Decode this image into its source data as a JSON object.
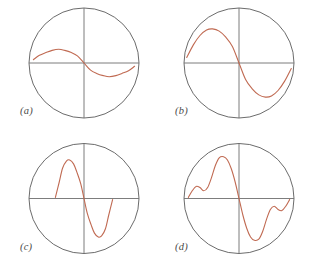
{
  "figure": {
    "background_color": "#ffffff",
    "panel_count": 4,
    "columns": 2,
    "rows": 2,
    "circle_stroke_color": "#5a5a5a",
    "axis_stroke_color": "#6e6e6e",
    "curve_stroke_color": "#c06a52",
    "label_color": "#4a4a4a"
  },
  "panels": [
    {
      "id": "panel-a",
      "label": "(a)",
      "label_x": 20,
      "label_y": 108,
      "circle": {
        "cx": 84,
        "cy": 63,
        "r": 55
      },
      "axes": {
        "horizontal": {
          "x1": 29,
          "y1": 63,
          "x2": 139,
          "y2": 63
        },
        "vertical": {
          "x1": 84,
          "y1": 8,
          "x2": 84,
          "y2": 118
        }
      },
      "chart_data": {
        "type": "line",
        "title": "(a)",
        "description": "single-cycle sine wave, low amplitude, wide span",
        "xlabel": "",
        "ylabel": "",
        "xlim": [
          -1,
          1
        ],
        "ylim": [
          -1,
          1
        ],
        "grid": false,
        "legend": "none",
        "harmonics": [
          {
            "n": 1,
            "amplitude": 0.25
          }
        ],
        "x": [
          -0.92,
          -0.81,
          -0.69,
          -0.58,
          -0.46,
          -0.35,
          -0.23,
          -0.12,
          0.0,
          0.12,
          0.23,
          0.35,
          0.46,
          0.58,
          0.69,
          0.81,
          0.92
        ],
        "y": [
          0.06,
          0.14,
          0.19,
          0.23,
          0.25,
          0.23,
          0.19,
          0.13,
          0.0,
          -0.13,
          -0.19,
          -0.23,
          -0.25,
          -0.23,
          -0.19,
          -0.14,
          -0.06
        ]
      }
    },
    {
      "id": "panel-b",
      "label": "(b)",
      "label_x": 20,
      "label_y": 108,
      "circle": {
        "cx": 84,
        "cy": 63,
        "r": 55
      },
      "axes": {
        "horizontal": {
          "x1": 29,
          "y1": 63,
          "x2": 139,
          "y2": 63
        },
        "vertical": {
          "x1": 84,
          "y1": 8,
          "x2": 84,
          "y2": 118
        }
      },
      "chart_data": {
        "type": "line",
        "title": "(b)",
        "description": "single-cycle sine wave, large amplitude, wide span",
        "xlabel": "",
        "ylabel": "",
        "xlim": [
          -1,
          1
        ],
        "ylim": [
          -1,
          1
        ],
        "grid": false,
        "legend": "none",
        "harmonics": [
          {
            "n": 1,
            "amplitude": 0.62
          }
        ],
        "x": [
          -0.95,
          -0.83,
          -0.71,
          -0.59,
          -0.48,
          -0.36,
          -0.24,
          -0.12,
          0.0,
          0.12,
          0.24,
          0.36,
          0.48,
          0.59,
          0.71,
          0.83,
          0.95
        ],
        "y": [
          0.1,
          0.33,
          0.5,
          0.6,
          0.62,
          0.58,
          0.47,
          0.3,
          0.0,
          -0.3,
          -0.47,
          -0.58,
          -0.62,
          -0.6,
          -0.5,
          -0.33,
          -0.1
        ]
      }
    },
    {
      "id": "panel-c",
      "label": "(c)",
      "label_x": 20,
      "label_y": 109,
      "circle": {
        "cx": 84,
        "cy": 63,
        "r": 55
      },
      "axes": {
        "horizontal": {
          "x1": 29,
          "y1": 63,
          "x2": 139,
          "y2": 63
        },
        "vertical": {
          "x1": 84,
          "y1": 8,
          "x2": 84,
          "y2": 118
        }
      },
      "chart_data": {
        "type": "line",
        "title": "(c)",
        "description": "narrow high-amplitude sine concentrated near center",
        "xlabel": "",
        "ylabel": "",
        "xlim": [
          -1,
          1
        ],
        "ylim": [
          -1,
          1
        ],
        "grid": false,
        "legend": "none",
        "harmonics": [
          {
            "n": 1,
            "amplitude": 0.7
          }
        ],
        "x": [
          -0.52,
          -0.45,
          -0.39,
          -0.32,
          -0.26,
          -0.19,
          -0.13,
          -0.06,
          0.0,
          0.06,
          0.13,
          0.19,
          0.26,
          0.32,
          0.39,
          0.45,
          0.52
        ],
        "y": [
          0.02,
          0.3,
          0.55,
          0.68,
          0.7,
          0.63,
          0.48,
          0.27,
          0.0,
          -0.27,
          -0.48,
          -0.63,
          -0.7,
          -0.68,
          -0.55,
          -0.3,
          -0.02
        ]
      }
    },
    {
      "id": "panel-d",
      "label": "(d)",
      "label_x": 20,
      "label_y": 109,
      "circle": {
        "cx": 84,
        "cy": 63,
        "r": 55
      },
      "axes": {
        "horizontal": {
          "x1": 29,
          "y1": 63,
          "x2": 139,
          "y2": 63
        },
        "vertical": {
          "x1": 84,
          "y1": 8,
          "x2": 84,
          "y2": 118
        }
      },
      "chart_data": {
        "type": "line",
        "title": "(d)",
        "description": "composite multi-harmonic odd-symmetric waveform with secondary ripples",
        "xlabel": "",
        "ylabel": "",
        "xlim": [
          -1,
          1
        ],
        "ylim": [
          -1,
          1
        ],
        "grid": false,
        "legend": "none",
        "harmonics": [
          {
            "n": 1,
            "amplitude": 0.58
          },
          {
            "n": 3,
            "amplitude": 0.2
          },
          {
            "n": 5,
            "amplitude": 0.11
          }
        ],
        "x": [
          -0.92,
          -0.85,
          -0.78,
          -0.71,
          -0.64,
          -0.57,
          -0.5,
          -0.43,
          -0.36,
          -0.28,
          -0.21,
          -0.14,
          -0.07,
          0.0,
          0.07,
          0.14,
          0.21,
          0.28,
          0.36,
          0.43,
          0.5,
          0.57,
          0.64,
          0.71,
          0.78,
          0.85,
          0.92
        ],
        "y": [
          0.02,
          0.14,
          0.22,
          0.2,
          0.14,
          0.2,
          0.38,
          0.6,
          0.74,
          0.76,
          0.7,
          0.54,
          0.3,
          0.0,
          -0.3,
          -0.54,
          -0.7,
          -0.76,
          -0.74,
          -0.6,
          -0.38,
          -0.2,
          -0.14,
          -0.2,
          -0.22,
          -0.14,
          -0.02
        ]
      }
    }
  ]
}
